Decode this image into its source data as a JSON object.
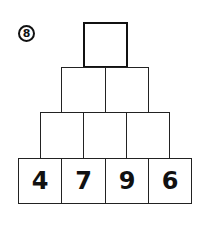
{
  "problem": {
    "number_label": "8"
  },
  "pyramid": {
    "rows": [
      {
        "cells": [
          ""
        ]
      },
      {
        "cells": [
          "",
          ""
        ]
      },
      {
        "cells": [
          "",
          "",
          ""
        ]
      },
      {
        "cells": [
          "4",
          "7",
          "9",
          "6"
        ]
      }
    ]
  }
}
